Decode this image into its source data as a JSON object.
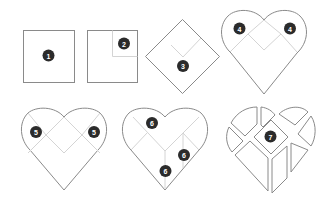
{
  "colors": {
    "outline": "#8a8a8a",
    "guide": "#d4d4d4",
    "badge": "#2b2b2b",
    "badge_text": "#ffffff",
    "background": "#ffffff"
  },
  "steps": [
    {
      "id": 1,
      "label": "1",
      "shape": "square",
      "description": "Plain square"
    },
    {
      "id": 2,
      "label": "2",
      "shape": "square-with-corner-fold",
      "description": "Square with top-right quarter marked"
    },
    {
      "id": 3,
      "label": "3",
      "shape": "diamond",
      "description": "Square rotated 45° with V crease"
    },
    {
      "id": 4,
      "label": "4",
      "shape": "heart",
      "description": "Heart with fold lines",
      "badges": [
        "4",
        "4"
      ]
    },
    {
      "id": 5,
      "label": "5",
      "shape": "heart",
      "description": "Heart with fold lines",
      "badges": [
        "5",
        "5"
      ]
    },
    {
      "id": 6,
      "label": "6",
      "shape": "heart",
      "description": "Heart with Y crease",
      "badges": [
        "6",
        "6",
        "6"
      ]
    },
    {
      "id": 7,
      "label": "7",
      "shape": "heart-puzzle",
      "description": "Heart divided into puzzle pieces"
    }
  ]
}
